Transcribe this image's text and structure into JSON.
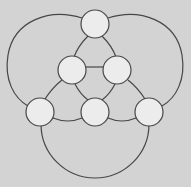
{
  "diagram": {
    "type": "graph",
    "background": "#d3d3d3",
    "node_fill": "#ececec",
    "stroke": "#474747",
    "node_radius": 14,
    "nodes": [
      {
        "id": "top",
        "x": 95,
        "y": 24
      },
      {
        "id": "mid-left",
        "x": 72,
        "y": 70
      },
      {
        "id": "mid-right",
        "x": 117,
        "y": 70
      },
      {
        "id": "bottom-left",
        "x": 40,
        "y": 112
      },
      {
        "id": "bottom-center",
        "x": 95,
        "y": 112
      },
      {
        "id": "bottom-right",
        "x": 149,
        "y": 112
      }
    ],
    "edges": [
      [
        "top",
        "mid-left"
      ],
      [
        "top",
        "mid-right"
      ],
      [
        "mid-left",
        "mid-right"
      ],
      [
        "mid-left",
        "bottom-left"
      ],
      [
        "mid-left",
        "bottom-center"
      ],
      [
        "mid-right",
        "bottom-center"
      ],
      [
        "mid-right",
        "bottom-right"
      ],
      [
        "bottom-left",
        "bottom-center"
      ],
      [
        "bottom-center",
        "bottom-right"
      ],
      [
        "top",
        "bottom-left",
        "outer-left-arc"
      ],
      [
        "top",
        "bottom-right",
        "outer-right-arc"
      ],
      [
        "bottom-left",
        "bottom-right",
        "outer-bottom-arc"
      ]
    ]
  }
}
